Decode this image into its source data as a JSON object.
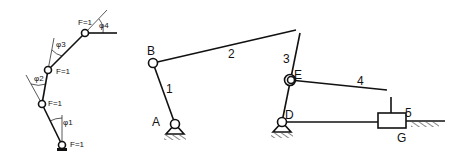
{
  "left_chain": {
    "dof_labels": [
      "F=1",
      "F=1",
      "F=1",
      "F=1"
    ],
    "angle_labels": [
      "φ1",
      "φ2",
      "φ3",
      "φ4"
    ]
  },
  "mechanism": {
    "joint_labels": {
      "A": "A",
      "B": "B",
      "D": "D",
      "E": "E",
      "G": "G"
    },
    "link_labels": {
      "l1": "1",
      "l2": "2",
      "l3": "3",
      "l4": "4",
      "l5": "5"
    }
  },
  "colors": {
    "stroke": "#111111",
    "background": "#ffffff"
  }
}
